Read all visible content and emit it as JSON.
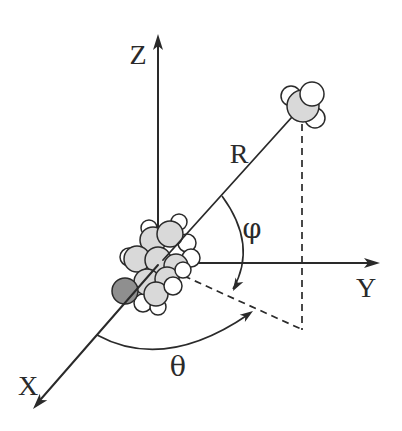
{
  "figure": {
    "axis_labels": {
      "z": "Z",
      "y": "Y",
      "x": "X"
    },
    "distance_label": "R",
    "angle_labels": {
      "phi": "φ",
      "theta": "θ"
    },
    "colors": {
      "line": "#2a2a2a",
      "text": "#2a2a2a",
      "atom-white": "#ffffff",
      "atom-light": "#d9d9d9",
      "atom-dark": "#8f8f8f",
      "background": "#ffffff"
    }
  }
}
